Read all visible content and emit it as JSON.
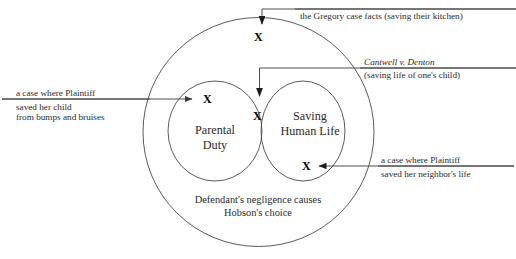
{
  "diagram": {
    "type": "venn",
    "universe_label_lines": [
      "Defendant's negligence causes",
      "Hobson's choice"
    ],
    "sets": [
      {
        "id": "parental-duty",
        "label_lines": [
          "Parental",
          "Duty"
        ]
      },
      {
        "id": "saving-human-life",
        "label_lines": [
          "Saving",
          "Human Life"
        ]
      }
    ],
    "markers": [
      {
        "id": "marker-gregory",
        "glyph": "X",
        "region": "universe-outside-sets"
      },
      {
        "id": "marker-child-bumps",
        "glyph": "X",
        "region": "parental-duty-only"
      },
      {
        "id": "marker-cantwell",
        "glyph": "X",
        "region": "intersection"
      },
      {
        "id": "marker-neighbor",
        "glyph": "X",
        "region": "saving-human-life-only"
      }
    ],
    "annotations": [
      {
        "id": "gregory-case",
        "lines": [
          "the Gregory case facts (saving their kitchen)"
        ],
        "italic_first_line": false,
        "points_to": "marker-gregory"
      },
      {
        "id": "cantwell-v-denton",
        "lines": [
          "Cantwell v. Denton",
          "(saving life of one's child)"
        ],
        "italic_first_line": true,
        "points_to": "marker-cantwell"
      },
      {
        "id": "plaintiff-saved-child",
        "lines": [
          "a case where Plaintiff",
          "saved her child",
          "from bumps and bruises"
        ],
        "italic_first_line": false,
        "points_to": "marker-child-bumps"
      },
      {
        "id": "plaintiff-saved-neighbor",
        "lines": [
          "a case where Plaintiff",
          "saved her neighbor's life"
        ],
        "italic_first_line": false,
        "points_to": "marker-neighbor"
      }
    ],
    "colors": {
      "stroke": "#4a4a4a",
      "text": "#2b2b2b",
      "marker": "#000000",
      "background": "#ffffff"
    }
  }
}
